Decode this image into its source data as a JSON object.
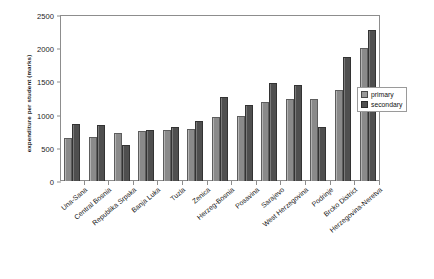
{
  "chart_data": {
    "type": "bar",
    "title": "",
    "xlabel": "",
    "ylabel": "expenditure per student (marks)",
    "ylim": [
      0,
      2500
    ],
    "yticks": [
      0,
      500,
      1000,
      1500,
      2000,
      2500
    ],
    "grid": false,
    "legend_position": "right",
    "categories": [
      "Una-Sana",
      "Central Bosnia",
      "Republika Srpska",
      "Banja Luka",
      "Tuzla",
      "Zenica",
      "Herzeg-Bosnia",
      "Posavina",
      "Sarajevo",
      "West Herzegovina",
      "Podrinje",
      "Brcko District",
      "Herzegovina-Neretva"
    ],
    "series": [
      {
        "name": "primary",
        "color": "#9a9a9a",
        "values": [
          650,
          670,
          730,
          755,
          775,
          785,
          970,
          975,
          1190,
          1240,
          1240,
          1370,
          2010
        ]
      },
      {
        "name": "secondary",
        "color": "#4f4f4f",
        "values": [
          860,
          850,
          540,
          770,
          810,
          900,
          1270,
          1150,
          1480,
          1440,
          820,
          1870,
          2280
        ]
      }
    ]
  }
}
